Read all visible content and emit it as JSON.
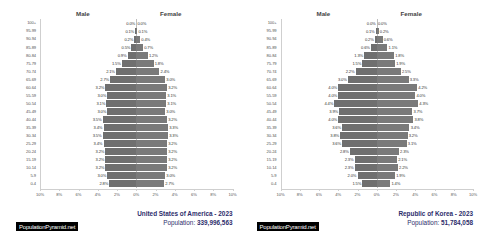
{
  "charts": [
    {
      "header": {
        "male": "Male",
        "female": "Female"
      },
      "title": "United States of America - 2023",
      "population_label": "Population:",
      "population_value": "339,996,563",
      "badge": "PopulationPyramid.net",
      "chart_data": {
        "type": "bar",
        "title": "United States of America - 2023",
        "xlabel": "",
        "ylabel": "",
        "xlim": [
          -10,
          10
        ],
        "grid": false,
        "legend": [
          "Male",
          "Female"
        ],
        "categories": [
          "100+",
          "95-99",
          "90-94",
          "85-89",
          "80-84",
          "75-79",
          "70-74",
          "65-69",
          "60-64",
          "55-59",
          "50-54",
          "45-49",
          "40-44",
          "35-39",
          "30-34",
          "25-29",
          "20-24",
          "15-19",
          "10-14",
          "5-9",
          "0-4"
        ],
        "series": [
          {
            "name": "Male",
            "values": [
              0.0,
              0.1,
              0.2,
              0.5,
              0.9,
              1.5,
              2.1,
              2.7,
              3.2,
              3.0,
              3.1,
              3.0,
              3.5,
              3.4,
              3.5,
              3.4,
              3.2,
              3.2,
              3.2,
              3.0,
              2.8
            ]
          },
          {
            "name": "Female",
            "values": [
              0.0,
              0.1,
              0.4,
              0.7,
              1.2,
              1.8,
              2.4,
              3.0,
              3.2,
              3.1,
              3.1,
              3.0,
              3.2,
              3.3,
              3.3,
              3.2,
              3.2,
              3.2,
              3.2,
              3.0,
              2.9
            ]
          }
        ],
        "male_labels": [
          "0.0%",
          "0.1%",
          "0.2%",
          "0.5%",
          "0.9%",
          "1.5%",
          "2.1%",
          "2.7%",
          "3.2%",
          "3.0%",
          "3.1%",
          "3.0%",
          "3.5%",
          "3.4%",
          "3.5%",
          "3.4%",
          "3.2%",
          "3.2%",
          "3.2%",
          "3.0%",
          "2.8%"
        ],
        "female_labels": [
          "0.0%",
          "0.1%",
          "0.4%",
          "0.7%",
          "1.2%",
          "1.8%",
          "2.4%",
          "3.0%",
          "3.2%",
          "3.1%",
          "3.1%",
          "3.0%",
          "3.2%",
          "3.3%",
          "3.3%",
          "3.2%",
          "3.2%",
          "3.2%",
          "3.2%",
          "3.0%",
          "2.7%"
        ],
        "xticks": [
          "10%",
          "8%",
          "6%",
          "4%",
          "2%",
          "0%",
          "2%",
          "4%",
          "6%",
          "8%",
          "10%"
        ]
      }
    },
    {
      "header": {
        "male": "Male",
        "female": "Female"
      },
      "title": "Republic of Korea - 2023",
      "population_label": "Population:",
      "population_value": "51,784,058",
      "badge": "PopulationPyramid.net",
      "chart_data": {
        "type": "bar",
        "title": "Republic of Korea - 2023",
        "xlabel": "",
        "ylabel": "",
        "xlim": [
          -10,
          10
        ],
        "grid": false,
        "legend": [
          "Male",
          "Female"
        ],
        "categories": [
          "100+",
          "95-99",
          "90-94",
          "85-89",
          "80-84",
          "75-79",
          "70-74",
          "65-69",
          "60-64",
          "55-59",
          "50-54",
          "45-49",
          "40-44",
          "35-39",
          "30-34",
          "25-29",
          "20-24",
          "15-19",
          "10-14",
          "5-9",
          "0-4"
        ],
        "series": [
          {
            "name": "Male",
            "values": [
              0.0,
              0.1,
              0.2,
              0.6,
              1.3,
              1.5,
              2.2,
              3.0,
              4.0,
              4.0,
              4.4,
              3.9,
              4.0,
              3.6,
              3.8,
              3.6,
              2.8,
              2.3,
              2.3,
              2.0,
              1.5
            ]
          },
          {
            "name": "Female",
            "values": [
              0.0,
              0.2,
              0.6,
              1.1,
              1.8,
              1.9,
              2.5,
              3.3,
              4.2,
              4.0,
              4.3,
              3.7,
              3.8,
              3.4,
              3.2,
              3.1,
              2.3,
              2.1,
              2.2,
              1.9,
              1.4
            ]
          }
        ],
        "male_labels": [
          "0.0%",
          "0.1%",
          "0.2%",
          "0.6%",
          "1.3%",
          "1.5%",
          "2.2%",
          "3.0%",
          "4.0%",
          "4.0%",
          "4.4%",
          "3.9%",
          "4.0%",
          "3.6%",
          "3.8%",
          "3.6%",
          "2.8%",
          "2.3%",
          "2.3%",
          "2.0%",
          "1.5%"
        ],
        "female_labels": [
          "0.0%",
          "0.2%",
          "0.6%",
          "1.1%",
          "1.8%",
          "1.9%",
          "2.5%",
          "3.3%",
          "4.2%",
          "4.0%",
          "4.3%",
          "3.7%",
          "3.8%",
          "3.4%",
          "3.2%",
          "3.1%",
          "2.3%",
          "2.1%",
          "2.2%",
          "1.9%",
          "1.4%"
        ],
        "xticks": [
          "10%",
          "8%",
          "6%",
          "4%",
          "2%",
          "0%",
          "2%",
          "4%",
          "6%",
          "8%",
          "10%"
        ]
      }
    }
  ]
}
